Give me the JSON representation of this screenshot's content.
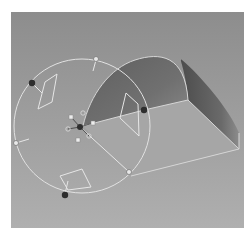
{
  "viewport": {
    "label": "3D modeling viewport",
    "background_top": "#8e8e8e",
    "background_bottom": "#adadad"
  },
  "model": {
    "name": "half-cylinder extrusion",
    "top_face_color": "#a9a9a9",
    "curved_face_color": "#6e6e6e",
    "end_face_color": "#7a7a7a",
    "edge_color": "#d8d8d8"
  },
  "manipulator": {
    "name": "rotate gizmo",
    "ring_color": "#e4e4e4",
    "handle_dark": "#2e2e2e",
    "handle_light": "#e8e8e8",
    "pivot_handles": 6
  }
}
